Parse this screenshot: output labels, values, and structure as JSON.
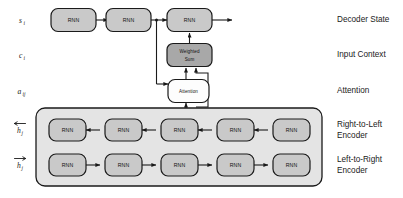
{
  "diagram": {
    "colors": {
      "node_fill": "#c9c9c9",
      "node_fill_dark": "#a8a8a8",
      "node_fill_light": "#fdfdfd",
      "node_stroke": "#1a1a1a",
      "encoder_panel_fill": "#e4e4e4",
      "encoder_panel_stroke": "#1a1a1a",
      "arrow": "#1a1a1a",
      "background": "#ffffff",
      "text": "#1a1a1a"
    },
    "node_label": "RNN",
    "rows": [
      {
        "id": "decoder-state",
        "left_symbol": "s",
        "left_subscript": "i",
        "right_label": "Decoder State",
        "node_count": 3
      },
      {
        "id": "input-context",
        "left_symbol": "c",
        "left_subscript": "i",
        "right_label": "Input Context",
        "center_node": "Weighted Sum",
        "center_node_line1": "Weighted",
        "center_node_line2": "Sum"
      },
      {
        "id": "attention",
        "left_symbol": "a",
        "left_subscript": "ij",
        "right_label": "Attention",
        "center_node": "Attention"
      },
      {
        "id": "right-to-left-encoder",
        "left_symbol": "h",
        "left_subscript": "j",
        "left_overbar": "left-arrow",
        "right_label_line1": "Right-to-Left",
        "right_label_line2": "Encoder",
        "node_count": 5,
        "direction": "right-to-left"
      },
      {
        "id": "left-to-right-encoder",
        "left_symbol": "h",
        "left_subscript": "j",
        "left_overbar": "right-arrow",
        "right_label_line1": "Left-to-Right",
        "right_label_line2": "Encoder",
        "node_count": 5,
        "direction": "left-to-right"
      }
    ]
  }
}
